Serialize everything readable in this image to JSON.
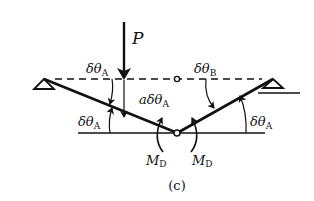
{
  "figure": {
    "caption": "(c)",
    "load_label": "P",
    "labels": {
      "left_top": {
        "base": "δθ",
        "sub": "A"
      },
      "right_top": {
        "base": "δθ",
        "sub": "B"
      },
      "center": {
        "prefix": "a",
        "base": "δθ",
        "sub": "A"
      },
      "left_bottom": {
        "base": "δθ",
        "sub": "A"
      },
      "right_bottom": {
        "base": "δθ",
        "sub": "A"
      },
      "moment_left": {
        "base": "M",
        "sub": "D"
      },
      "moment_right": {
        "base": "M",
        "sub": "D"
      }
    },
    "colors": {
      "stroke": "#111111",
      "background": "#ffffff"
    }
  }
}
